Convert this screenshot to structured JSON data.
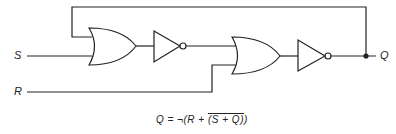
{
  "diagram": {
    "inputs": [
      {
        "id": "S",
        "label": "S"
      },
      {
        "id": "R",
        "label": "R"
      }
    ],
    "output": {
      "id": "Q",
      "label": "Q"
    },
    "gates": [
      {
        "id": "or1",
        "type": "OR",
        "inputs": [
          "Q",
          "S"
        ]
      },
      {
        "id": "not1",
        "type": "NOT",
        "inputs": [
          "or1"
        ]
      },
      {
        "id": "or2",
        "type": "OR",
        "inputs": [
          "not1",
          "R"
        ]
      },
      {
        "id": "not2",
        "type": "NOT",
        "inputs": [
          "or2"
        ]
      }
    ],
    "feedback": "Q output fed back to first OR gate input",
    "formula": {
      "lhs": "Q = ¬(R + ",
      "overline": "(S + Q)",
      "rhs": ")"
    }
  }
}
